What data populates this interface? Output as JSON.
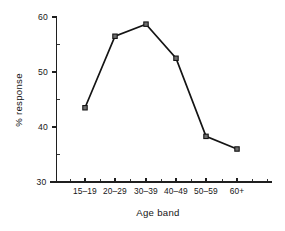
{
  "chart_data": {
    "type": "line",
    "title": "",
    "subtitle": "",
    "xlabel": "Age band",
    "ylabel": "% response",
    "categories": [
      "15–19",
      "20–29",
      "30–39",
      "40–49",
      "50–59",
      "60+"
    ],
    "values": [
      43.5,
      56.5,
      58.7,
      52.5,
      38.3,
      36.0
    ],
    "series": [
      {
        "name": "% response",
        "values": [
          43.5,
          56.5,
          58.7,
          52.5,
          38.3,
          36.0
        ]
      }
    ],
    "ylim": [
      30,
      60
    ],
    "ytick_labels": [
      "30",
      "40",
      "50",
      "60"
    ],
    "ytick_values": [
      30,
      40,
      50,
      60
    ],
    "yminor_values": [
      32,
      34,
      36,
      38,
      42,
      44,
      46,
      48,
      52,
      54,
      56,
      58
    ],
    "xtick_labels": [
      "15–19",
      "20–29",
      "30–39",
      "40–49",
      "50–59",
      "60+"
    ],
    "grid": false,
    "legend": false,
    "legend_position": "none",
    "marker": "square",
    "line_color": "#141414",
    "marker_fill_color": "#6e6e6e",
    "marker_edge_color": "#141414",
    "axis_color": "#1f1f1f",
    "background_color": "#ffffff"
  },
  "figure": {
    "name": "percent-response-by-age-band-line-chart"
  }
}
